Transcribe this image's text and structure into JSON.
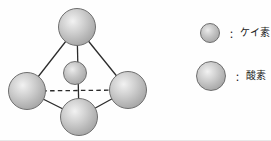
{
  "figure": {
    "background_color": "#fefefe"
  },
  "structure": {
    "name": "silicon-oxygen-tetrahedron",
    "bond_color": "#2b2b2b",
    "hidden_edge_style": "dashed",
    "atoms": [
      {
        "id": "oxygen-top",
        "element": "oxygen",
        "cx": 77,
        "cy": 27,
        "r": 19
      },
      {
        "id": "oxygen-left",
        "element": "oxygen",
        "cx": 27,
        "cy": 91,
        "r": 19
      },
      {
        "id": "oxygen-right",
        "element": "oxygen",
        "cx": 128,
        "cy": 90,
        "r": 19
      },
      {
        "id": "oxygen-bottom",
        "element": "oxygen",
        "cx": 79,
        "cy": 117,
        "r": 19
      },
      {
        "id": "silicon-center",
        "element": "silicon",
        "cx": 75,
        "cy": 73,
        "r": 12
      }
    ],
    "edges": [
      {
        "from": "oxygen-top",
        "to": "oxygen-left",
        "style": "solid"
      },
      {
        "from": "oxygen-top",
        "to": "oxygen-right",
        "style": "solid"
      },
      {
        "from": "oxygen-top",
        "to": "oxygen-bottom",
        "style": "solid"
      },
      {
        "from": "oxygen-left",
        "to": "oxygen-bottom",
        "style": "solid"
      },
      {
        "from": "oxygen-right",
        "to": "oxygen-bottom",
        "style": "solid"
      },
      {
        "from": "oxygen-left",
        "to": "oxygen-right",
        "style": "dashed"
      }
    ]
  },
  "legend": {
    "items": [
      {
        "key": "silicon",
        "colon": "：",
        "label": "ケイ素",
        "marker": "sphere-small",
        "marker_cx": 210,
        "marker_cy": 33,
        "marker_r": 10
      },
      {
        "key": "oxygen",
        "colon": "：",
        "label": "酸素",
        "marker": "sphere-large",
        "marker_cx": 211,
        "marker_cy": 76,
        "marker_r": 15
      }
    ]
  }
}
